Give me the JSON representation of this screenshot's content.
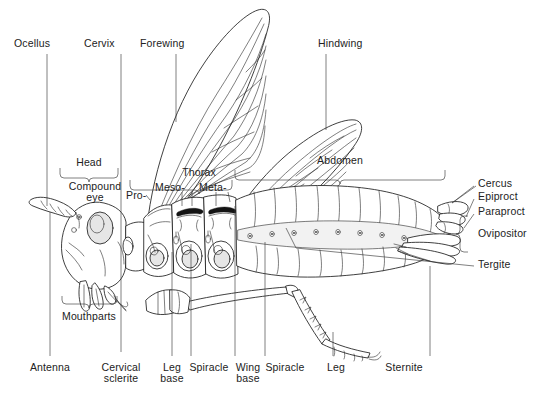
{
  "figure": {
    "background_color": "#ffffff",
    "ink_color": "#1d1d1d",
    "leader_color": "#3a3a3a"
  },
  "labels_top": [
    {
      "text": "Ocellus",
      "x": 14,
      "y": 38,
      "leader_x": 47,
      "leader_y1": 54,
      "leader_y2": 205
    },
    {
      "text": "Cervix",
      "x": 84,
      "y": 38,
      "leader_x": 121,
      "leader_y1": 54,
      "leader_y2": 352
    },
    {
      "text": "Forewing",
      "x": 140,
      "y": 38,
      "leader_x": 176,
      "leader_y1": 54,
      "leader_y2": 120
    },
    {
      "text": "Hindwing",
      "x": 318,
      "y": 38,
      "leader_x": 326,
      "leader_y1": 54,
      "leader_y2": 130
    }
  ],
  "labels_mid": [
    {
      "text": "Head",
      "x": 89,
      "y": 158
    },
    {
      "text": "Thorax",
      "x": 199,
      "y": 168
    },
    {
      "text": "Abdomen",
      "x": 340,
      "y": 156
    },
    {
      "text": "Compound\neye",
      "x": 69,
      "y": 182
    },
    {
      "text": "Pro-",
      "x": 128,
      "y": 192
    },
    {
      "text": "Meso-",
      "x": 158,
      "y": 184
    },
    {
      "text": "Meta-",
      "x": 202,
      "y": 184
    },
    {
      "text": "Mouthparts",
      "x": 62,
      "y": 312
    }
  ],
  "labels_right": [
    {
      "text": "Cercus",
      "x": 478,
      "y": 179,
      "leader_x1": 420,
      "leader_y1": 205,
      "leader_x2": 474,
      "leader_y2": 184
    },
    {
      "text": "Epiproct",
      "x": 478,
      "y": 192,
      "leader_x1": 432,
      "leader_y1": 213,
      "leader_x2": 474,
      "leader_y2": 197
    },
    {
      "text": "Paraproct",
      "x": 478,
      "y": 207,
      "leader_x1": 437,
      "leader_y1": 222,
      "leader_x2": 474,
      "leader_y2": 212
    },
    {
      "text": "Ovipositor",
      "x": 478,
      "y": 228,
      "leader_x1": 0,
      "leader_y1": 0,
      "leader_x2": 0,
      "leader_y2": 0
    },
    {
      "text": "Tergite",
      "x": 478,
      "y": 259,
      "leader_x1": 286,
      "leader_y1": 228,
      "leader_x2": 474,
      "leader_y2": 264
    }
  ],
  "labels_bottom": [
    {
      "text": "Antenna",
      "x": 40,
      "y": 363,
      "leader_x": 50,
      "leader_y1": 210,
      "leader_y2": 356
    },
    {
      "text": "Cervical\nsclerite",
      "x": 90,
      "y": 363,
      "leader_x": 121,
      "leader_y1": 245,
      "leader_y2": 356
    },
    {
      "text": "Leg\nbase",
      "x": 163,
      "y": 363,
      "leader_x": 172,
      "leader_y1": 248,
      "leader_y2": 356
    },
    {
      "text": "Spiracle",
      "x": 190,
      "y": 363,
      "leader_x": 191,
      "leader_y1": 243,
      "leader_y2": 356
    },
    {
      "text": "Wing\nbase",
      "x": 237,
      "y": 363,
      "leader_x": 235,
      "leader_y1": 210,
      "leader_y2": 356
    },
    {
      "text": "Spiracle",
      "x": 264,
      "y": 363,
      "leader_x": 265,
      "leader_y1": 240,
      "leader_y2": 356
    },
    {
      "text": "Leg",
      "x": 336,
      "y": 363,
      "leader_x": 333,
      "leader_y1": 330,
      "leader_y2": 356
    },
    {
      "text": "Sternite",
      "x": 404,
      "y": 363,
      "leader_x": 430,
      "leader_y1": 268,
      "leader_y2": 356
    }
  ],
  "brackets": {
    "head": {
      "x1": 60,
      "x2": 118,
      "y": 172,
      "tip_x": 89,
      "dir": "down"
    },
    "thorax": {
      "x1": 130,
      "x2": 232,
      "y": 178,
      "tip_x": 199,
      "dir": "down"
    },
    "abdomen": {
      "x1": 235,
      "x2": 445,
      "y": 172,
      "tip_x": 340,
      "dir": "down"
    },
    "mouthparts": {
      "x1": 62,
      "x2": 117,
      "y": 300,
      "tip_x": 89,
      "dir": "up"
    },
    "ovipositor": {
      "y1": 216,
      "y2": 253,
      "x": 462,
      "tip_y": 234,
      "dir": "right"
    }
  },
  "anatomy_parts": [
    "ocellus",
    "cervix",
    "forewing",
    "hindwing",
    "head",
    "thorax",
    "abdomen",
    "compound-eye",
    "prothorax",
    "mesothorax",
    "metathorax",
    "mouthparts",
    "cercus",
    "epiproct",
    "paraproct",
    "ovipositor",
    "tergite",
    "antenna",
    "cervical-sclerite",
    "leg-base",
    "spiracle",
    "wing-base",
    "leg",
    "sternite"
  ]
}
